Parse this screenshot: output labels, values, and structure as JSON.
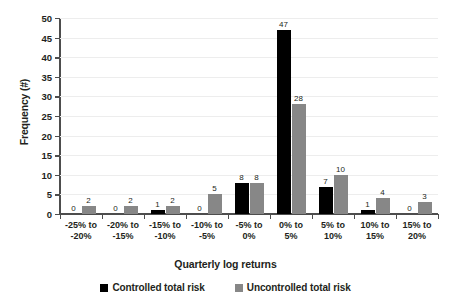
{
  "chart_data": {
    "type": "bar",
    "title": "",
    "xlabel": "Quarterly log returns",
    "ylabel": "Frequency (#)",
    "ylim": [
      0,
      50
    ],
    "yticks": [
      0,
      5,
      10,
      15,
      20,
      25,
      30,
      35,
      40,
      45,
      50
    ],
    "grid": true,
    "legend_position": "bottom",
    "categories": [
      "-25% to -20%",
      "-20% to -15%",
      "-15% to -10%",
      "-10% to -5%",
      "-5% to 0%",
      "0% to 5%",
      "5% to 10%",
      "10% to 15%",
      "15% to 20%"
    ],
    "category_lines": [
      [
        "-25% to",
        "-20%"
      ],
      [
        "-20% to",
        "-15%"
      ],
      [
        "-15% to",
        "-10%"
      ],
      [
        "-10% to",
        "-5%"
      ],
      [
        "-5% to",
        "0%"
      ],
      [
        "0% to",
        "5%"
      ],
      [
        "5% to",
        "10%"
      ],
      [
        "10% to",
        "15%"
      ],
      [
        "15% to",
        "20%"
      ]
    ],
    "series": [
      {
        "name": "Controlled total risk",
        "color": "#000000",
        "values": [
          0,
          0,
          1,
          0,
          8,
          47,
          7,
          1,
          0
        ]
      },
      {
        "name": "Uncontrolled total risk",
        "color": "#878787",
        "values": [
          2,
          2,
          2,
          5,
          8,
          28,
          10,
          4,
          3
        ]
      }
    ]
  }
}
